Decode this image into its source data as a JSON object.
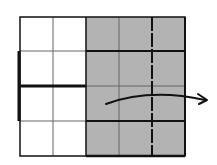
{
  "diagram": {
    "rows": 4,
    "columns": 5,
    "shaded_columns": [
      3,
      4,
      5
    ],
    "colors": {
      "shade": "#b3b3b3",
      "line": "#111111",
      "thin_line": "#555555",
      "background": "#ffffff"
    },
    "arrow": {
      "direction": "right",
      "meaning": "curved arrow indicating movement to the right"
    }
  }
}
